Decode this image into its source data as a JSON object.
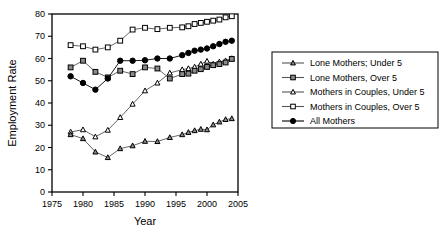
{
  "figure": {
    "background": "#ffffff",
    "frame_color": "#000000",
    "width": 445,
    "height": 240
  },
  "chart_data": {
    "type": "line",
    "title": "",
    "xlabel": "Year",
    "ylabel": "Employment Rate",
    "xlim": [
      1975,
      2005
    ],
    "ylim": [
      0,
      80
    ],
    "xticks": [
      1975,
      1980,
      1985,
      1990,
      1995,
      2000,
      2005
    ],
    "yticks": [
      0,
      10,
      20,
      30,
      40,
      50,
      60,
      70,
      80
    ],
    "xtick_labels": [
      "1975",
      "1980",
      "1985",
      "1990",
      "1995",
      "2000",
      "2005"
    ],
    "ytick_labels": [
      "0",
      "10",
      "20",
      "30",
      "40",
      "50",
      "60",
      "70",
      "80"
    ],
    "grid": false,
    "legend_position": "right-outside",
    "series": [
      {
        "name": "Lone Mothers; Under 5",
        "marker": "triangle-filled",
        "marker_fill": "#8a8a8a",
        "marker_edge": "#000000",
        "line_color": "#555555",
        "x": [
          1978,
          1980,
          1982,
          1984,
          1986,
          1988,
          1990,
          1992,
          1994,
          1996,
          1997,
          1998,
          1999,
          2000,
          2001,
          2002,
          2003,
          2004
        ],
        "y": [
          25.8,
          24.0,
          18.0,
          15.5,
          19.5,
          20.8,
          22.8,
          22.7,
          24.5,
          25.8,
          26.8,
          27.6,
          28.2,
          28.0,
          30.2,
          31.5,
          32.6,
          33.0
        ]
      },
      {
        "name": "Lone Mothers, Over 5",
        "marker": "square-filled",
        "marker_fill": "#8a8a8a",
        "marker_edge": "#000000",
        "line_color": "#555555",
        "x": [
          1978,
          1980,
          1982,
          1984,
          1986,
          1988,
          1990,
          1992,
          1994,
          1996,
          1997,
          1998,
          1999,
          2000,
          2001,
          2002,
          2003,
          2004
        ],
        "y": [
          56.0,
          59.0,
          54.0,
          51.5,
          54.5,
          53.0,
          56.0,
          55.5,
          51.0,
          53.0,
          53.2,
          54.5,
          55.2,
          56.2,
          57.0,
          57.5,
          58.2,
          59.8
        ]
      },
      {
        "name": "Mothers in Couples, Under 5",
        "marker": "triangle-open",
        "marker_fill": "#ffffff",
        "marker_edge": "#000000",
        "line_color": "#555555",
        "x": [
          1978,
          1980,
          1982,
          1984,
          1986,
          1988,
          1990,
          1992,
          1994,
          1996,
          1997,
          1998,
          1999,
          2000,
          2001,
          2002,
          2003,
          2004
        ],
        "y": [
          27.0,
          28.0,
          24.8,
          27.8,
          33.5,
          39.5,
          45.5,
          49.0,
          53.5,
          55.0,
          55.5,
          56.2,
          57.5,
          58.8,
          57.5,
          58.5,
          59.0,
          60.0
        ]
      },
      {
        "name": "Mothers in Couples, Over 5",
        "marker": "square-open",
        "marker_fill": "#ffffff",
        "marker_edge": "#000000",
        "line_color": "#555555",
        "x": [
          1978,
          1980,
          1982,
          1984,
          1986,
          1988,
          1990,
          1992,
          1994,
          1996,
          1997,
          1998,
          1999,
          2000,
          2001,
          2002,
          2003,
          2004
        ],
        "y": [
          66.0,
          65.5,
          64.0,
          65.0,
          68.0,
          73.0,
          73.8,
          73.2,
          73.8,
          74.0,
          74.5,
          75.5,
          76.0,
          76.5,
          77.0,
          77.5,
          78.5,
          79.0
        ]
      },
      {
        "name": "All Mothers",
        "marker": "circle-filled",
        "marker_fill": "#000000",
        "marker_edge": "#000000",
        "line_color": "#000000",
        "x": [
          1978,
          1980,
          1982,
          1984,
          1986,
          1988,
          1990,
          1992,
          1994,
          1996,
          1997,
          1998,
          1999,
          2000,
          2001,
          2002,
          2003,
          2004
        ],
        "y": [
          52.0,
          49.0,
          46.0,
          51.0,
          59.0,
          59.0,
          59.2,
          60.0,
          60.0,
          61.5,
          62.5,
          63.5,
          64.0,
          64.5,
          65.5,
          66.5,
          67.5,
          68.0
        ]
      }
    ]
  },
  "legend": {
    "entries": [
      {
        "label": "Lone Mothers; Under 5"
      },
      {
        "label": "Lone Mothers, Over 5"
      },
      {
        "label": "Mothers in Couples, Under 5"
      },
      {
        "label": "Mothers in Couples, Over 5"
      },
      {
        "label": "All Mothers"
      }
    ]
  }
}
